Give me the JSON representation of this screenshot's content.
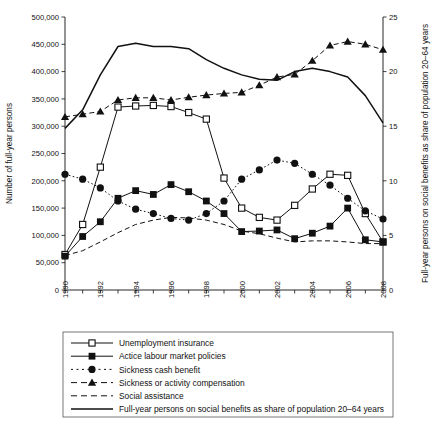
{
  "chart_data": {
    "type": "line",
    "title": "",
    "xlabel": "",
    "ylabel": "Number of full-year persons",
    "y2label": "Full-year persons on social benefits as share of population 20–64 years",
    "x": [
      1990,
      1991,
      1992,
      1993,
      1994,
      1995,
      1996,
      1997,
      1998,
      1999,
      2000,
      2001,
      2002,
      2003,
      2004,
      2005,
      2006,
      2007,
      2008
    ],
    "xticklabels": [
      "1990",
      "1992",
      "1994",
      "1996",
      "1998",
      "2000",
      "2002",
      "2004",
      "2006",
      "2008"
    ],
    "xtickvalues": [
      1990,
      1992,
      1994,
      1996,
      1998,
      2000,
      2002,
      2004,
      2006,
      2008
    ],
    "yticklabels": [
      "0",
      "50,000",
      "100,000",
      "150,000",
      "200,000",
      "250,000",
      "300,000",
      "350,000",
      "400,000",
      "450,000",
      "500,000"
    ],
    "ytickvalues": [
      0,
      50000,
      100000,
      150000,
      200000,
      250000,
      300000,
      350000,
      400000,
      450000,
      500000
    ],
    "ylim": [
      0,
      500000
    ],
    "y2ticklabels": [
      "0",
      "5",
      "10",
      "15",
      "20",
      "25"
    ],
    "y2tickvalues": [
      0,
      5,
      10,
      15,
      20,
      25
    ],
    "y2lim": [
      0,
      25
    ],
    "grid": false,
    "legend_position": "below-axes",
    "series": [
      {
        "name": "Unemployment insurance",
        "marker": "open-square",
        "linestyle": "solid",
        "axis": "left",
        "values": [
          65000,
          120000,
          225000,
          335000,
          337000,
          338000,
          336000,
          325000,
          313000,
          205000,
          150000,
          133000,
          128000,
          155000,
          185000,
          212000,
          210000,
          140000,
          88000
        ]
      },
      {
        "name": "Actice labour market policies",
        "marker": "filled-square",
        "linestyle": "solid",
        "axis": "left",
        "values": [
          62000,
          98000,
          125000,
          168000,
          182000,
          175000,
          193000,
          180000,
          163000,
          140000,
          107000,
          108000,
          110000,
          94000,
          104000,
          117000,
          150000,
          92000,
          88000
        ]
      },
      {
        "name": "Sickness cash benefit",
        "marker": "filled-circle",
        "linestyle": "dotted",
        "axis": "left",
        "values": [
          212000,
          203000,
          187000,
          163000,
          148000,
          140000,
          131000,
          128000,
          140000,
          163000,
          203000,
          220000,
          238000,
          232000,
          212000,
          192000,
          168000,
          145000,
          130000
        ]
      },
      {
        "name": "Sickness or activity compensation",
        "marker": "filled-triangle",
        "linestyle": "dashed",
        "axis": "left",
        "values": [
          317000,
          322000,
          327000,
          348000,
          352000,
          352000,
          348000,
          353000,
          357000,
          360000,
          362000,
          375000,
          390000,
          395000,
          420000,
          448000,
          455000,
          450000,
          440000
        ]
      },
      {
        "name": "Social assistance",
        "marker": "none",
        "linestyle": "dashed",
        "axis": "left",
        "values": [
          63000,
          72000,
          88000,
          105000,
          120000,
          128000,
          133000,
          132000,
          128000,
          120000,
          108000,
          103000,
          95000,
          88000,
          90000,
          90000,
          88000,
          85000,
          85000
        ]
      },
      {
        "name": "Full-year persons on social benefits as share of population 20–64 years",
        "marker": "none",
        "linestyle": "solid-thick",
        "axis": "right",
        "values": [
          14.8,
          16.5,
          19.7,
          22.3,
          22.6,
          22.3,
          22.3,
          22.1,
          21.1,
          20.3,
          19.7,
          19.3,
          19.2,
          20.0,
          20.3,
          20.0,
          19.5,
          17.8,
          15.3
        ]
      }
    ]
  },
  "legend": {
    "entries": [
      {
        "label": "Unemployment insurance"
      },
      {
        "label": "Actice labour market policies"
      },
      {
        "label": "Sickness cash benefit"
      },
      {
        "label": "Sickness or activity compensation"
      },
      {
        "label": "Social assistance"
      },
      {
        "label": "Full-year persons on social benefits as share of population 20–64 years"
      }
    ]
  }
}
